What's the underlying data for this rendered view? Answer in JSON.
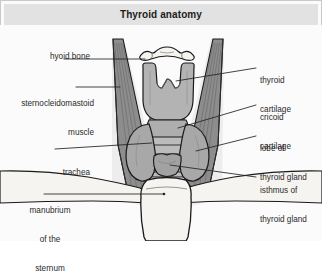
{
  "figure": {
    "title": "Thyroid anatomy",
    "background_color": "#fbfbfb",
    "title_band_color": "#e2e2e2",
    "border_color": "#c9c9c9"
  },
  "labels": {
    "left": [
      {
        "name": "hyoid-bone",
        "text": "hyoid bone",
        "align": "right"
      },
      {
        "name": "sternocleidomastoid-muscle",
        "line1": "sternocleidomastoid",
        "line2": "muscle",
        "align": "right"
      },
      {
        "name": "trachea",
        "text": "trachea",
        "align": "right"
      },
      {
        "name": "manubrium-of-the-sternum",
        "line1": "manubrium",
        "line2": "of the",
        "line3": "sternum",
        "align": "center"
      }
    ],
    "right": [
      {
        "name": "thyroid-cartilage",
        "line1": "thyroid",
        "line2": "cartilage",
        "align": "left"
      },
      {
        "name": "cricoid-cartilage",
        "line1": "cricoid",
        "line2": "cartilage",
        "align": "left"
      },
      {
        "name": "lobe-of-thyroid-gland",
        "line1": "lobe of",
        "line2": "thyroid gland",
        "align": "left"
      },
      {
        "name": "isthmus-of-thyroid-gland",
        "line1": "isthmus of",
        "line2": "thyroid gland",
        "align": "left"
      }
    ]
  },
  "anatomy": {
    "structures": [
      "hyoid bone",
      "thyroid cartilage",
      "cricoid cartilage",
      "thyroid gland lobe",
      "thyroid gland isthmus",
      "trachea",
      "sternocleidomastoid muscle",
      "manubrium of the sternum",
      "clavicle"
    ],
    "colors": {
      "bone": "#f4f2ee",
      "cartilage": "#b3b3b3",
      "gland": "#a8a8a8",
      "muscle": "#8e8e8e",
      "muscle_dark": "#6e6e6e",
      "trachea": "#bcbcbc",
      "outline": "#1a1a1a",
      "leader_line": "#222222"
    }
  }
}
